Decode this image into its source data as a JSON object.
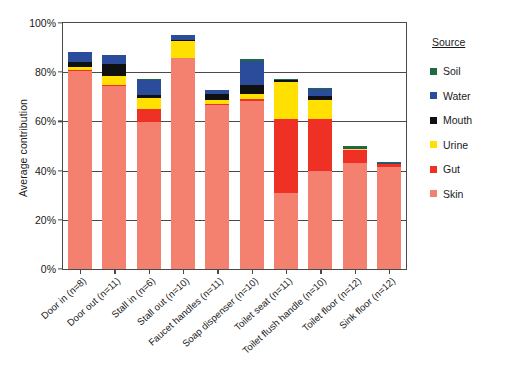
{
  "chart_data": {
    "type": "bar",
    "subtype": "stacked-bar",
    "title": "",
    "xlabel": "",
    "ylabel": "Average contribution",
    "ylim": [
      0,
      100
    ],
    "ytick_labels": [
      "0%",
      "20%",
      "40%",
      "60%",
      "80%",
      "100%"
    ],
    "ytick_values": [
      0,
      20,
      40,
      60,
      80,
      100
    ],
    "grid": "horizontal",
    "legend_position": "right",
    "legend_title": "Source",
    "categories": [
      "Door in (n=8)",
      "Door out (n=11)",
      "Stall in (n=6)",
      "Stall out (n=10)",
      "Faucet handles (n=11)",
      "Soap dispenser (n=10)",
      "Toilet seat (n=11)",
      "Toilet flush handle (n=10)",
      "Toilet floor (n=12)",
      "Sink floor (n=12)"
    ],
    "series": [
      {
        "name": "Skin",
        "color": "#F4806F",
        "values": [
          80.5,
          74.3,
          59.8,
          85.8,
          66.8,
          68.2,
          31.0,
          39.8,
          43.2,
          41.5
        ]
      },
      {
        "name": "Gut",
        "color": "#EE3124",
        "values": [
          0.5,
          0.4,
          5.3,
          0.0,
          0.3,
          1.0,
          30.0,
          21.0,
          5.2,
          1.0
        ]
      },
      {
        "name": "Urine",
        "color": "#FFE000",
        "values": [
          1.0,
          3.6,
          4.5,
          7.0,
          1.7,
          1.9,
          15.0,
          7.8,
          0.2,
          0.2
        ]
      },
      {
        "name": "Mouth",
        "color": "#101010",
        "values": [
          2.0,
          5.0,
          1.0,
          0.3,
          2.4,
          3.6,
          1.0,
          1.6,
          0.0,
          0.0
        ]
      },
      {
        "name": "Water",
        "color": "#2B4C9B",
        "values": [
          4.3,
          3.5,
          6.4,
          2.2,
          1.4,
          10.0,
          0.0,
          3.0,
          0.4,
          0.2
        ]
      },
      {
        "name": "Soil",
        "color": "#1E6B41",
        "values": [
          0.0,
          0.0,
          0.3,
          0.0,
          0.0,
          0.6,
          0.3,
          0.3,
          0.9,
          0.4
        ]
      }
    ],
    "totals": [
      88.3,
      86.8,
      77.3,
      95.3,
      72.6,
      85.3,
      77.3,
      73.5,
      49.9,
      43.3
    ]
  },
  "legend": {
    "title": "Source",
    "items": [
      {
        "label": "Soil",
        "color": "#1E6B41"
      },
      {
        "label": "Water",
        "color": "#2B4C9B"
      },
      {
        "label": "Mouth",
        "color": "#101010"
      },
      {
        "label": "Urine",
        "color": "#FFE000"
      },
      {
        "label": "Gut",
        "color": "#EE3124"
      },
      {
        "label": "Skin",
        "color": "#F4806F"
      }
    ]
  },
  "axes": {
    "y_title": "Average contribution"
  }
}
